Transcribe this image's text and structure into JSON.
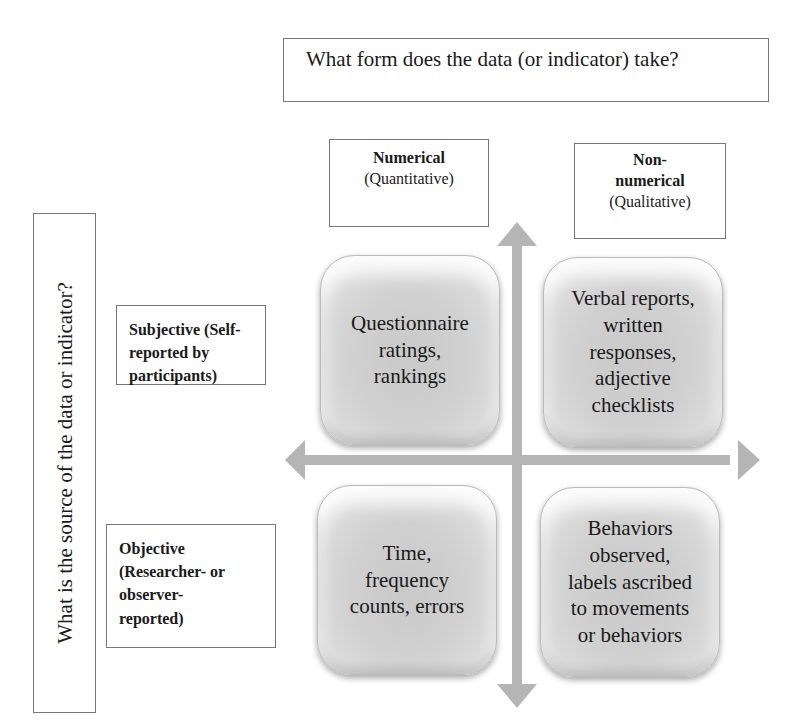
{
  "diagram": {
    "type": "2x2 quadrant matrix",
    "top_question": "What form does the data (or indicator) take?",
    "side_question": "What is the source of the data or indicator?",
    "columns": [
      {
        "label": "Numerical (Quantitative)",
        "lines": [
          "Numerical",
          "(Quantitative)"
        ]
      },
      {
        "label": "Non-numerical (Qualitative)",
        "lines": [
          "Non-",
          "numerical",
          "(Qualitative)"
        ]
      }
    ],
    "rows": [
      {
        "label": "Subjective (Self-reported by participants)",
        "lines": [
          "Subjective (Self-",
          "reported by",
          "participants)"
        ]
      },
      {
        "label": "Objective (Researcher- or observer-reported)",
        "lines": [
          "Objective",
          "(Researcher- or",
          "observer-",
          "reported)"
        ]
      }
    ],
    "quadrants": [
      {
        "row": "Subjective",
        "column": "Numerical",
        "lines": [
          "Questionnaire",
          "ratings,",
          "rankings"
        ]
      },
      {
        "row": "Subjective",
        "column": "Non-numerical",
        "lines": [
          "Verbal reports,",
          "written",
          "responses,",
          "adjective",
          "checklists"
        ]
      },
      {
        "row": "Objective",
        "column": "Numerical",
        "lines": [
          "Time,",
          "frequency",
          "counts, errors"
        ]
      },
      {
        "row": "Objective",
        "column": "Non-numerical",
        "lines": [
          "Behaviors",
          "observed,",
          "labels ascribed",
          "to movements",
          "or behaviors"
        ]
      }
    ],
    "axes": {
      "horizontal": "double-headed arrow (left/right)",
      "vertical": "double-headed arrow (up/down)"
    },
    "colors": {
      "arrow": "#b5b5b5",
      "quadrant_fill": "#d0d0d0",
      "box_border": "#777777",
      "text": "#1a1a1a"
    }
  }
}
